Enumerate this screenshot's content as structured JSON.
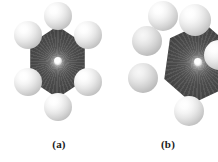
{
  "figure": {
    "background_color": "#ffffff",
    "width_px": 218,
    "height_px": 162,
    "molecule": "benzene",
    "representation": "space-filling",
    "ring_core_color": "#4a4a4a",
    "atom_color": "#e0e0e0",
    "caption_color": "#1a1a1a"
  },
  "panels": [
    {
      "id": "a",
      "caption": "(a)",
      "orientation": "face-on hexagonal ring view",
      "hydrogen_count": 6,
      "cropped": false
    },
    {
      "id": "b",
      "caption": "(b)",
      "orientation": "tilted / edge-rotated ring view",
      "hydrogen_count": 6,
      "cropped": true
    }
  ]
}
